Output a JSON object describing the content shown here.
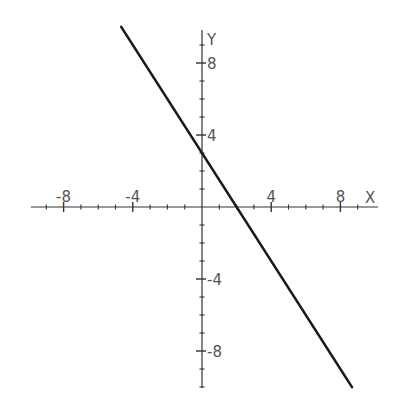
{
  "chart_data": {
    "type": "line",
    "title": "",
    "xlabel": "X",
    "ylabel": "Y",
    "xlim": [
      -10,
      10
    ],
    "ylim": [
      -10,
      10
    ],
    "grid": false,
    "legend": null,
    "x_tick_labels": [
      "-8",
      "-4",
      "4",
      "8"
    ],
    "y_tick_labels": [
      "8",
      "4",
      "-4",
      "-8"
    ],
    "x_ticks_minor_step": 1,
    "y_ticks_minor_step": 1,
    "series": [
      {
        "name": "y = -1.5x + 3",
        "slope": -1.5,
        "intercept": 3,
        "x": [
          -4.67,
          0,
          2,
          8.67
        ],
        "y": [
          10,
          3,
          0,
          -10
        ],
        "color": "#1a1a1a"
      }
    ]
  },
  "axes": {
    "x_label": "X",
    "y_label": "Y",
    "axis_color": "#333333",
    "line_color": "#1a1a1a"
  }
}
